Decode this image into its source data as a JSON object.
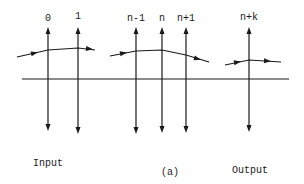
{
  "figure": {
    "caption": "(a)",
    "axis": {
      "x1": 22,
      "x2": 289,
      "y": 79
    },
    "lenses": [
      {
        "label": "0",
        "x": 48,
        "y_top": 27,
        "y_bottom": 131
      },
      {
        "label": "1",
        "x": 78,
        "y_top": 27,
        "y_bottom": 134
      },
      {
        "label": "n-1",
        "x": 136,
        "y_top": 27,
        "y_bottom": 134
      },
      {
        "label": "n",
        "x": 162,
        "y_top": 27,
        "y_bottom": 133
      },
      {
        "label": "n+1",
        "x": 186,
        "y_top": 27,
        "y_bottom": 133
      },
      {
        "label": "n+k",
        "x": 249,
        "y_top": 27,
        "y_bottom": 132
      }
    ],
    "rays": [
      {
        "points": [
          [
            17,
            57
          ],
          [
            48,
            50
          ],
          [
            78,
            48
          ],
          [
            95,
            50
          ]
        ],
        "arrows": [
          [
            35,
            53
          ],
          [
            90,
            49
          ]
        ]
      },
      {
        "points": [
          [
            110,
            56
          ],
          [
            136,
            51
          ],
          [
            162,
            50
          ],
          [
            186,
            55
          ],
          [
            209,
            62
          ]
        ],
        "arrows": [
          [
            124,
            53
          ],
          [
            198,
            59
          ]
        ]
      },
      {
        "points": [
          [
            225,
            65
          ],
          [
            249,
            60
          ],
          [
            281,
            62
          ]
        ],
        "arrows": [
          [
            238,
            62
          ],
          [
            268,
            61
          ]
        ]
      }
    ],
    "input_label": {
      "line1": "Input",
      "line2": "lens"
    },
    "output_label": {
      "line1": "Output",
      "line2": "lens"
    },
    "line_color": "#1a1a1a"
  }
}
